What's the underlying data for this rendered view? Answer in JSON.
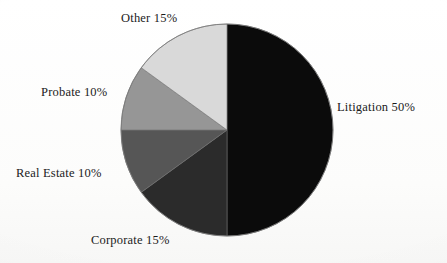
{
  "chart_data": {
    "type": "pie",
    "title": "",
    "subtitle": "",
    "xlabel": "",
    "ylabel": "",
    "legend_position": "none",
    "grid": false,
    "units": "percent",
    "start_angle_deg": 0,
    "direction": "clockwise",
    "center": {
      "x": 227,
      "y": 130
    },
    "radius": 106,
    "categories": [
      "Litigation",
      "Corporate",
      "Real Estate",
      "Probate",
      "Other"
    ],
    "values": [
      50,
      15,
      10,
      10,
      15
    ],
    "labels": [
      "Litigation 50%",
      "Corporate 15%",
      "Real Estate 10%",
      "Probate 10%",
      "Other 15%"
    ],
    "slices": [
      {
        "name": "Litigation",
        "label": "Litigation 50%",
        "value": 50,
        "color": "#0b0b0b",
        "start_deg": 0,
        "end_deg": 180
      },
      {
        "name": "Corporate",
        "label": "Corporate 15%",
        "value": 15,
        "color": "#2b2b2b",
        "start_deg": 180,
        "end_deg": 234
      },
      {
        "name": "Real Estate",
        "label": "Real Estate 10%",
        "value": 10,
        "color": "#565656",
        "start_deg": 234,
        "end_deg": 270
      },
      {
        "name": "Probate",
        "label": "Probate 10%",
        "value": 10,
        "color": "#969696",
        "start_deg": 270,
        "end_deg": 306
      },
      {
        "name": "Other",
        "label": "Other 15%",
        "value": 15,
        "color": "#d9d9d9",
        "start_deg": 306,
        "end_deg": 360
      }
    ],
    "colors": {
      "litigation": "#0b0b0b",
      "corporate": "#2b2b2b",
      "real_estate": "#565656",
      "probate": "#969696",
      "other": "#d9d9d9",
      "outline": "#6b6b6b",
      "background": "#fdfdfc",
      "text": "#1b1b1b"
    }
  }
}
